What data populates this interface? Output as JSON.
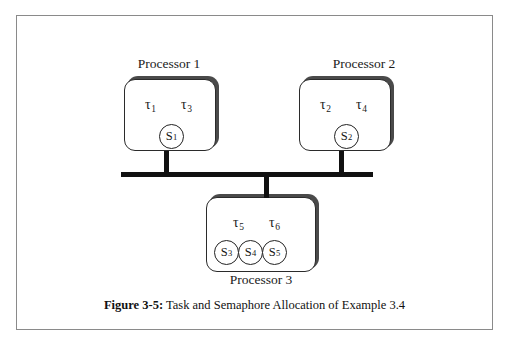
{
  "figure": {
    "caption_label": "Figure 3-5:",
    "caption_text": "Task and Semaphore Allocation of Example 3.4"
  },
  "processors": [
    {
      "id": "processor-1",
      "label": "Processor 1",
      "label_position": "above",
      "tasks": [
        {
          "symbol": "τ",
          "index": "1"
        },
        {
          "symbol": "τ",
          "index": "3"
        }
      ],
      "semaphores": [
        {
          "symbol": "S",
          "index": "1"
        }
      ]
    },
    {
      "id": "processor-2",
      "label": "Processor 2",
      "label_position": "above",
      "tasks": [
        {
          "symbol": "τ",
          "index": "2"
        },
        {
          "symbol": "τ",
          "index": "4"
        }
      ],
      "semaphores": [
        {
          "symbol": "S",
          "index": "2"
        }
      ]
    },
    {
      "id": "processor-3",
      "label": "Processor 3",
      "label_position": "below",
      "tasks": [
        {
          "symbol": "τ",
          "index": "5"
        },
        {
          "symbol": "τ",
          "index": "6"
        }
      ],
      "semaphores": [
        {
          "symbol": "S",
          "index": "3"
        },
        {
          "symbol": "S",
          "index": "4"
        },
        {
          "symbol": "S",
          "index": "5"
        }
      ]
    }
  ],
  "bus": {
    "name": "shared-bus",
    "connected_processors": [
      "processor-1",
      "processor-2",
      "processor-3"
    ]
  },
  "colors": {
    "frame": "#8a8a8a",
    "box_outline": "#2b2b2b",
    "box_shadow": "#4a4a4a",
    "bus": "#111111",
    "text": "#1a1a1a",
    "background": "#ffffff"
  }
}
